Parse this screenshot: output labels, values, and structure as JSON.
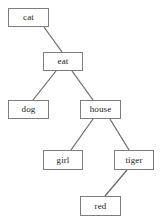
{
  "diagram": {
    "type": "tree",
    "title": "",
    "canvas": {
      "width": 161,
      "height": 222,
      "background": "#ffffff"
    },
    "style": {
      "node_border_color": "#7d7d7d",
      "node_fill_color": "#ffffff",
      "edge_color": "#666666",
      "text_color": "#1a1a1a"
    },
    "nodes": [
      {
        "id": "n1",
        "label": "cat",
        "x": 8,
        "y": 8,
        "w": 41,
        "h": 19
      },
      {
        "id": "n2",
        "label": "eat",
        "x": 43,
        "y": 52,
        "w": 40,
        "h": 19
      },
      {
        "id": "n3",
        "label": "dog",
        "x": 8,
        "y": 100,
        "w": 41,
        "h": 19
      },
      {
        "id": "n4",
        "label": "house",
        "x": 80,
        "y": 100,
        "w": 41,
        "h": 19
      },
      {
        "id": "n5",
        "label": "girl",
        "x": 43,
        "y": 150,
        "w": 40,
        "h": 20
      },
      {
        "id": "n6",
        "label": "tiger",
        "x": 114,
        "y": 150,
        "w": 40,
        "h": 20
      },
      {
        "id": "n7",
        "label": "red",
        "x": 80,
        "y": 196,
        "w": 41,
        "h": 20
      }
    ],
    "edges": [
      {
        "from": "n1",
        "to": "n2",
        "x1": 44,
        "y1": 27,
        "x2": 62,
        "y2": 52
      },
      {
        "from": "n2",
        "to": "n3",
        "x1": 56,
        "y1": 71,
        "x2": 33,
        "y2": 100
      },
      {
        "from": "n2",
        "to": "n4",
        "x1": 72,
        "y1": 71,
        "x2": 93,
        "y2": 100
      },
      {
        "from": "n4",
        "to": "n5",
        "x1": 93,
        "y1": 119,
        "x2": 71,
        "y2": 150
      },
      {
        "from": "n4",
        "to": "n6",
        "x1": 110,
        "y1": 119,
        "x2": 129,
        "y2": 150
      },
      {
        "from": "n6",
        "to": "n7",
        "x1": 127,
        "y1": 170,
        "x2": 105,
        "y2": 196
      }
    ]
  }
}
